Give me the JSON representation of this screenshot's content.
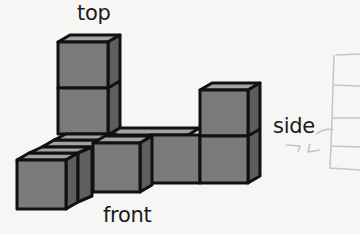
{
  "labels": {
    "top": "top",
    "front": "front",
    "side": "side"
  },
  "colors": {
    "background": "#f6f6f4",
    "front_face": "#7b7b7b",
    "top_face": "#a2a2a2",
    "side_face": "#5e5e5e",
    "outline": "#111111",
    "sketch": "#c4c4c4"
  },
  "figure": {
    "cube_count": 9,
    "views": [
      "top",
      "front",
      "side"
    ]
  }
}
